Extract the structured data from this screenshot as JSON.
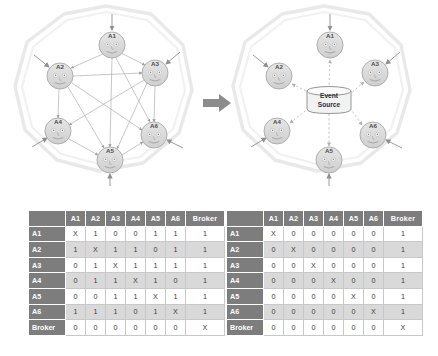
{
  "figure": {
    "transition_arrow": "arrow-right"
  },
  "diagram_left": {
    "name": "direct-peer-to-peer-topology",
    "ring_shape": "decagon",
    "nodes": [
      {
        "id": "A1",
        "label": "A1",
        "cx": 112,
        "cy": 45
      },
      {
        "id": "A2",
        "label": "A2",
        "cx": 60,
        "cy": 76
      },
      {
        "id": "A3",
        "label": "A3",
        "cx": 155,
        "cy": 73
      },
      {
        "id": "A4",
        "label": "A4",
        "cx": 58,
        "cy": 131
      },
      {
        "id": "A5",
        "label": "A5",
        "cx": 110,
        "cy": 160
      },
      {
        "id": "A6",
        "label": "A6",
        "cx": 154,
        "cy": 135
      }
    ],
    "edges": [
      [
        "A1",
        "A2"
      ],
      [
        "A1",
        "A3"
      ],
      [
        "A1",
        "A5"
      ],
      [
        "A1",
        "A6"
      ],
      [
        "A2",
        "A3"
      ],
      [
        "A2",
        "A4"
      ],
      [
        "A2",
        "A5"
      ],
      [
        "A2",
        "A6"
      ],
      [
        "A3",
        "A4"
      ],
      [
        "A3",
        "A5"
      ],
      [
        "A3",
        "A6"
      ],
      [
        "A4",
        "A5"
      ],
      [
        "A5",
        "A6"
      ]
    ],
    "external_arrows": [
      {
        "to": "A1",
        "from_side": "top"
      },
      {
        "to": "A2",
        "from_side": "upper-left"
      },
      {
        "to": "A3",
        "from_side": "upper-right"
      },
      {
        "to": "A4",
        "from_side": "lower-left"
      },
      {
        "to": "A5",
        "from_side": "bottom"
      },
      {
        "to": "A6",
        "from_side": "lower-right"
      }
    ]
  },
  "diagram_right": {
    "name": "event-source-broker-topology",
    "ring_shape": "decagon",
    "broker": {
      "id": "Broker",
      "label_line1": "Event",
      "label_line2": "Source",
      "shape": "cylinder",
      "cx": 329,
      "cy": 100
    },
    "nodes": [
      {
        "id": "A1",
        "label": "A1",
        "cx": 330,
        "cy": 45
      },
      {
        "id": "A2",
        "label": "A2",
        "cx": 279,
        "cy": 76
      },
      {
        "id": "A3",
        "label": "A3",
        "cx": 375,
        "cy": 73
      },
      {
        "id": "A4",
        "label": "A4",
        "cx": 277,
        "cy": 131
      },
      {
        "id": "A5",
        "label": "A5",
        "cx": 329,
        "cy": 160
      },
      {
        "id": "A6",
        "label": "A6",
        "cx": 373,
        "cy": 135
      }
    ],
    "edges": [
      [
        "Broker",
        "A1"
      ],
      [
        "Broker",
        "A2"
      ],
      [
        "Broker",
        "A3"
      ],
      [
        "Broker",
        "A4"
      ],
      [
        "Broker",
        "A5"
      ],
      [
        "Broker",
        "A6"
      ]
    ],
    "edge_style": "dashed",
    "external_arrows": [
      {
        "to": "A1",
        "from_side": "top"
      },
      {
        "to": "A2",
        "from_side": "upper-left"
      },
      {
        "to": "A3",
        "from_side": "upper-right"
      },
      {
        "to": "A4",
        "from_side": "lower-left"
      },
      {
        "to": "A5",
        "from_side": "bottom"
      },
      {
        "to": "A6",
        "from_side": "lower-right"
      }
    ]
  },
  "table_left": {
    "name": "connection-matrix-direct",
    "corner": "",
    "columns": [
      "A1",
      "A2",
      "A3",
      "A4",
      "A5",
      "A6",
      "Broker"
    ],
    "rows": [
      {
        "header": "A1",
        "cells": [
          "X",
          "1",
          "0",
          "0",
          "1",
          "1",
          "1"
        ]
      },
      {
        "header": "A2",
        "cells": [
          "1",
          "X",
          "1",
          "1",
          "0",
          "1",
          "1"
        ]
      },
      {
        "header": "A3",
        "cells": [
          "0",
          "1",
          "X",
          "1",
          "1",
          "1",
          "1"
        ]
      },
      {
        "header": "A4",
        "cells": [
          "0",
          "1",
          "1",
          "X",
          "1",
          "0",
          "1"
        ]
      },
      {
        "header": "A5",
        "cells": [
          "0",
          "0",
          "1",
          "1",
          "X",
          "1",
          "1"
        ]
      },
      {
        "header": "A6",
        "cells": [
          "1",
          "1",
          "1",
          "0",
          "1",
          "X",
          "1"
        ]
      },
      {
        "header": "Broker",
        "cells": [
          "0",
          "0",
          "0",
          "0",
          "0",
          "0",
          "X"
        ]
      }
    ]
  },
  "table_right": {
    "name": "connection-matrix-broker",
    "corner": "",
    "columns": [
      "A1",
      "A2",
      "A3",
      "A4",
      "A5",
      "A6",
      "Broker"
    ],
    "rows": [
      {
        "header": "A1",
        "cells": [
          "X",
          "0",
          "0",
          "0",
          "0",
          "0",
          "1"
        ]
      },
      {
        "header": "A2",
        "cells": [
          "0",
          "X",
          "0",
          "0",
          "0",
          "0",
          "1"
        ]
      },
      {
        "header": "A3",
        "cells": [
          "0",
          "0",
          "X",
          "0",
          "0",
          "0",
          "1"
        ]
      },
      {
        "header": "A4",
        "cells": [
          "0",
          "0",
          "0",
          "X",
          "0",
          "0",
          "1"
        ]
      },
      {
        "header": "A5",
        "cells": [
          "0",
          "0",
          "0",
          "0",
          "X",
          "0",
          "1"
        ]
      },
      {
        "header": "A6",
        "cells": [
          "0",
          "0",
          "0",
          "0",
          "0",
          "X",
          "1"
        ]
      },
      {
        "header": "Broker",
        "cells": [
          "0",
          "0",
          "0",
          "0",
          "0",
          "0",
          "X"
        ]
      }
    ]
  },
  "colors": {
    "header_gray": "#7d7d7d",
    "row_stripe": "#d9d9d9",
    "cell_border": "#c8c8c8",
    "node_fill": "#d8d8d8",
    "node_stroke": "#9a9a9a",
    "ring_stroke": "#e2e2e2",
    "edge_stroke": "#a0a0a0",
    "arrow_gray": "#8f8f8f",
    "text_dark": "#3a3a3a"
  }
}
